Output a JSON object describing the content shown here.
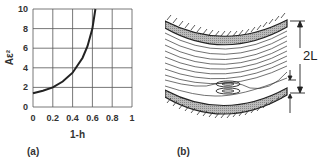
{
  "panels": {
    "a": {
      "label": "(a)",
      "chart": {
        "xlabel": "1-h",
        "ylabel": "Aε²",
        "xticks": [
          "0",
          "0.2",
          "0.4",
          "0.6",
          "0.8",
          "1"
        ],
        "yticks": [
          "0",
          "2",
          "4",
          "6",
          "8",
          "10"
        ]
      }
    },
    "b": {
      "label": "(b)",
      "dimension_2L": "2L",
      "dimension_l": "l"
    }
  },
  "chart_data": {
    "type": "line",
    "title": "",
    "xlabel": "1-h",
    "ylabel": "Aε²",
    "xlim": [
      0,
      1
    ],
    "ylim": [
      0,
      10
    ],
    "grid": true,
    "xticks": [
      0,
      0.2,
      0.4,
      0.6,
      0.8,
      1
    ],
    "yticks": [
      0,
      2,
      4,
      6,
      8,
      10
    ],
    "series": [
      {
        "name": "Aε² vs 1-h",
        "x": [
          0,
          0.1,
          0.2,
          0.3,
          0.4,
          0.5,
          0.55,
          0.6,
          0.63
        ],
        "y": [
          1.4,
          1.65,
          2.0,
          2.6,
          3.5,
          5.0,
          6.2,
          8.0,
          10.0
        ]
      }
    ]
  }
}
